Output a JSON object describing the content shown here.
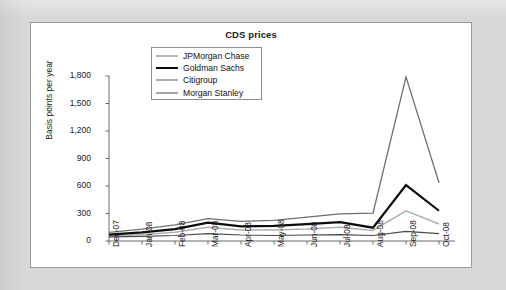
{
  "panel": {
    "title": "CDS prices"
  },
  "chart_data": {
    "type": "line",
    "title": "CDS prices",
    "xlabel": "",
    "ylabel": "Basis points per year",
    "ylim": [
      0,
      1800
    ],
    "ytick_values": [
      0,
      300,
      600,
      900,
      1200,
      1500,
      1800
    ],
    "ytick_labels": [
      "0",
      "300",
      "600",
      "900",
      "1,200",
      "1,500",
      "1,800"
    ],
    "grid": false,
    "legend_position": "top-center-inside",
    "categories": [
      "Dec-07",
      "Jan-08",
      "Feb-08",
      "Mar-08",
      "Apr-08",
      "May-08",
      "Jun-08",
      "Jul-08",
      "Aug-08",
      "Sep-08",
      "Oct-08"
    ],
    "series": [
      {
        "name": "JPMorgan Chase",
        "color": "#6f6f6f",
        "width": 1.3,
        "values": [
          95,
          130,
          175,
          245,
          215,
          225,
          260,
          295,
          305,
          1790,
          635
        ]
      },
      {
        "name": "Goldman Sachs",
        "color": "#0d0d0d",
        "width": 2.2,
        "values": [
          70,
          95,
          130,
          200,
          160,
          165,
          185,
          205,
          145,
          610,
          330
        ]
      },
      {
        "name": "Citigroup",
        "color": "#b0b0b0",
        "width": 1.5,
        "values": [
          55,
          70,
          95,
          150,
          120,
          120,
          130,
          150,
          115,
          330,
          185
        ]
      },
      {
        "name": "Morgan Stanley",
        "color": "#4a4a4a",
        "width": 1.1,
        "values": [
          45,
          50,
          60,
          80,
          65,
          60,
          65,
          70,
          60,
          105,
          80
        ]
      }
    ]
  }
}
